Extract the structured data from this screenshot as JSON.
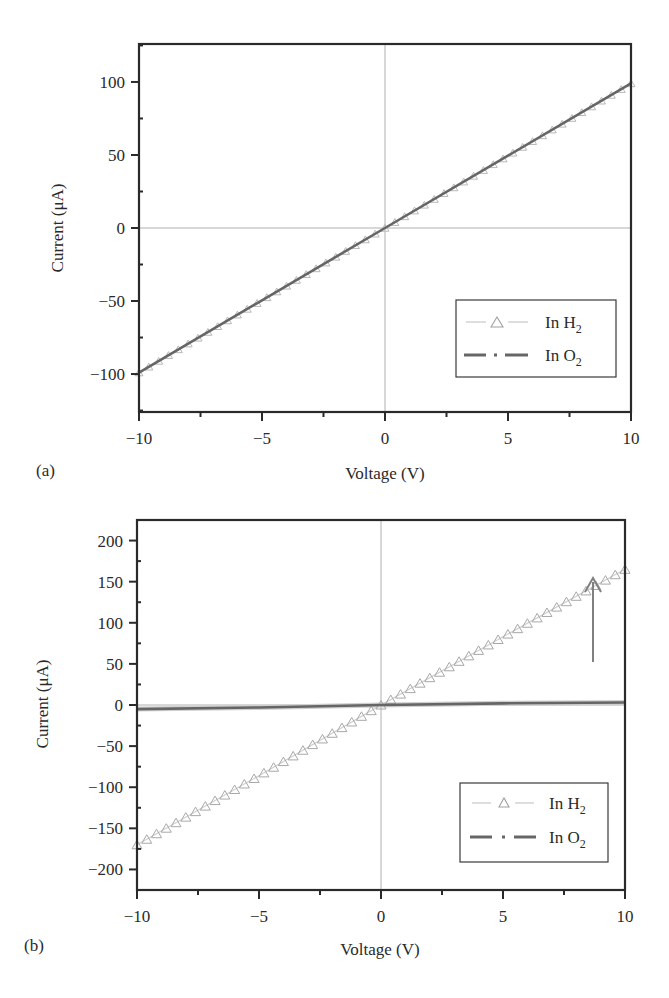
{
  "chart_data": [
    {
      "panel": "(a)",
      "type": "line",
      "title": "",
      "xlabel": "Voltage (V)",
      "ylabel": "Current (μA)",
      "xlim": [
        -10,
        10
      ],
      "ylim": [
        -126,
        126
      ],
      "xticks": [
        -10,
        -5,
        0,
        5,
        10
      ],
      "yticks": [
        -100,
        -50,
        0,
        50,
        100
      ],
      "grid": "zero lines only (x=0, y=0)",
      "legend_position": "lower right",
      "series": [
        {
          "name": "In H2",
          "label_main": "In H",
          "label_sub": "2",
          "style": "light gray line with open triangle markers",
          "color": "#b8b8b8",
          "x": [
            -10,
            -5,
            0,
            5,
            10
          ],
          "values": [
            -99,
            -49.5,
            0,
            49.5,
            99
          ]
        },
        {
          "name": "In O2",
          "label_main": "In O",
          "label_sub": "2",
          "style": "dark gray dash-dot line",
          "color": "#666666",
          "x": [
            -10,
            -5,
            0,
            5,
            10
          ],
          "values": [
            -99,
            -49.5,
            0,
            49.5,
            99
          ]
        }
      ]
    },
    {
      "panel": "(b)",
      "type": "line",
      "title": "",
      "xlabel": "Voltage (V)",
      "ylabel": "Current (μA)",
      "xlim": [
        -10,
        10
      ],
      "ylim": [
        -225,
        225
      ],
      "xticks": [
        -10,
        -5,
        0,
        5,
        10
      ],
      "yticks": [
        -200,
        -150,
        -100,
        -50,
        0,
        50,
        100,
        150,
        200
      ],
      "grid": "zero lines only (x=0, y=0)",
      "legend_position": "lower right",
      "annotations": [
        {
          "type": "arrow",
          "direction": "up",
          "x": 8.8,
          "y_from": 15,
          "y_to": 125
        }
      ],
      "series": [
        {
          "name": "In H2",
          "label_main": "In H",
          "label_sub": "2",
          "style": "light gray line with open triangle markers",
          "color": "#a8a8a8",
          "x": [
            -10,
            -5,
            0,
            5,
            10
          ],
          "values": [
            -170,
            -86,
            0,
            83,
            165
          ]
        },
        {
          "name": "In O2",
          "label_main": "In O",
          "label_sub": "2",
          "style": "dark gray dash-dot line",
          "color": "#666666",
          "x": [
            -10,
            -5,
            0,
            5,
            10
          ],
          "values": [
            -5,
            -3,
            0,
            2,
            3
          ]
        }
      ]
    }
  ],
  "panels": {
    "a": {
      "label": "(a)",
      "xlabel": "Voltage (V)",
      "ylabel": "Current (μA)",
      "xtick_labels": [
        "−10",
        "−5",
        "0",
        "5",
        "10"
      ],
      "ytick_labels": [
        "100",
        "50",
        "0",
        "−50",
        "−100"
      ],
      "legend": {
        "h2_main": "In H",
        "h2_sub": "2",
        "o2_main": "In O",
        "o2_sub": "2"
      }
    },
    "b": {
      "label": "(b)",
      "xlabel": "Voltage (V)",
      "ylabel": "Current (μA)",
      "xtick_labels": [
        "−10",
        "−5",
        "0",
        "5",
        "10"
      ],
      "ytick_labels": [
        "200",
        "150",
        "100",
        "50",
        "0",
        "−50",
        "−100",
        "−150",
        "−200"
      ],
      "legend": {
        "h2_main": "In H",
        "h2_sub": "2",
        "o2_main": "In O",
        "o2_sub": "2"
      }
    }
  },
  "colors": {
    "axis": "#2a2a2a",
    "zero_line": "#b0b0b0",
    "h2_series": "#b0b0b0",
    "o2_series": "#6a6a6a",
    "arrow": "#808080"
  }
}
